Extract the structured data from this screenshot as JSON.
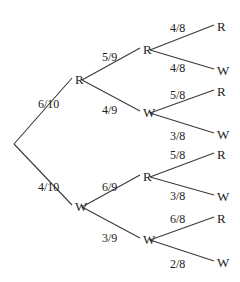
{
  "diagram": {
    "type": "probability-tree",
    "root": {
      "x": 14,
      "y": 144
    },
    "levels": [
      {
        "nodes": [
          {
            "id": "R",
            "label": "R",
            "x": 75,
            "y": 80,
            "parent": "root",
            "prob": "6/10",
            "prob_x": 38,
            "prob_y": 108
          },
          {
            "id": "W",
            "label": "W",
            "x": 75,
            "y": 207,
            "parent": "root",
            "prob": "4/10",
            "prob_x": 38,
            "prob_y": 191
          }
        ]
      },
      {
        "nodes": [
          {
            "id": "RR",
            "label": "R",
            "x": 143,
            "y": 50,
            "parent": "R",
            "prob": "5/9",
            "prob_x": 102,
            "prob_y": 61
          },
          {
            "id": "RW",
            "label": "W",
            "x": 143,
            "y": 113,
            "parent": "R",
            "prob": "4/9",
            "prob_x": 102,
            "prob_y": 114
          },
          {
            "id": "WR",
            "label": "R",
            "x": 143,
            "y": 177,
            "parent": "W",
            "prob": "6/9",
            "prob_x": 102,
            "prob_y": 191
          },
          {
            "id": "WW",
            "label": "W",
            "x": 143,
            "y": 240,
            "parent": "W",
            "prob": "3/9",
            "prob_x": 102,
            "prob_y": 242
          }
        ]
      },
      {
        "nodes": [
          {
            "id": "RRR",
            "label": "R",
            "x": 217,
            "y": 27,
            "parent": "RR",
            "prob": "4/8",
            "prob_x": 170,
            "prob_y": 32
          },
          {
            "id": "RRW",
            "label": "W",
            "x": 217,
            "y": 71,
            "parent": "RR",
            "prob": "4/8",
            "prob_x": 170,
            "prob_y": 72
          },
          {
            "id": "RWR",
            "label": "R",
            "x": 217,
            "y": 92,
            "parent": "RW",
            "prob": "5/8",
            "prob_x": 170,
            "prob_y": 99
          },
          {
            "id": "RWW",
            "label": "W",
            "x": 217,
            "y": 135,
            "parent": "RW",
            "prob": "3/8",
            "prob_x": 170,
            "prob_y": 140
          },
          {
            "id": "WRR",
            "label": "R",
            "x": 217,
            "y": 155,
            "parent": "WR",
            "prob": "5/8",
            "prob_x": 170,
            "prob_y": 159
          },
          {
            "id": "WRW",
            "label": "W",
            "x": 217,
            "y": 197,
            "parent": "WR",
            "prob": "3/8",
            "prob_x": 170,
            "prob_y": 200
          },
          {
            "id": "WWR",
            "label": "R",
            "x": 217,
            "y": 219,
            "parent": "WW",
            "prob": "6/8",
            "prob_x": 170,
            "prob_y": 223
          },
          {
            "id": "WWW",
            "label": "W",
            "x": 217,
            "y": 263,
            "parent": "WW",
            "prob": "2/8",
            "prob_x": 170,
            "prob_y": 268
          }
        ]
      }
    ]
  }
}
